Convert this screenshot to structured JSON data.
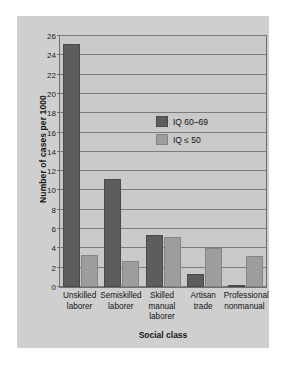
{
  "chart_data": {
    "type": "bar",
    "title": "",
    "xlabel": "Social class",
    "ylabel": "Number of cases per 1000",
    "categories": [
      "Unskilled laborer",
      "Semiskilled laborer",
      "Skilled manual laborer",
      "Artisan trade",
      "Professional nonmanual"
    ],
    "category_lines": [
      [
        "Unskilled",
        "laborer"
      ],
      [
        "Semiskilled",
        "laborer"
      ],
      [
        "Skilled",
        "manual",
        "laborer"
      ],
      [
        "Artisan",
        "trade"
      ],
      [
        "Professional",
        "nonmanual"
      ]
    ],
    "series": [
      {
        "name": "IQ 60–69",
        "color": "#5d5d5d",
        "values": [
          25.2,
          11.2,
          5.4,
          1.4,
          0.1
        ]
      },
      {
        "name": "IQ ≤ 50",
        "color": "#9d9d9d",
        "values": [
          3.3,
          2.7,
          5.2,
          4.0,
          3.2
        ]
      }
    ],
    "ylim": [
      0,
      26
    ],
    "ytick_step": 2,
    "yticks": [
      0,
      2,
      4,
      6,
      8,
      10,
      12,
      14,
      16,
      18,
      20,
      22,
      24,
      26
    ],
    "grid": true,
    "legend_position": "upper-center"
  },
  "colors": {
    "panel_background": "#cfcfcf",
    "plot_background": "#c9c9c9",
    "gridline": "#7c7c7c",
    "axis": "#6f6f6f",
    "text": "#141414",
    "series_dark": "#5d5d5d",
    "series_light": "#9d9d9d"
  }
}
